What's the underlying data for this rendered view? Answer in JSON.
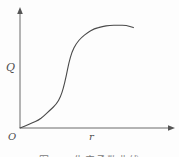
{
  "figure": {
    "y_axis_label": "Q",
    "x_axis_label": "r",
    "origin_label": "O",
    "caption": "图1-1 生产函数曲线"
  },
  "colors": {
    "axis": "#6b6b6b",
    "curve": "#4a4a4a",
    "label_text": "#4d4d4d",
    "background": "#fdfdfd"
  },
  "chart_data": {
    "type": "line",
    "title": "",
    "xlabel": "r",
    "ylabel": "Q",
    "origin_label": "O",
    "xlim": [
      0,
      1
    ],
    "ylim": [
      0,
      1
    ],
    "grid": false,
    "legend": "none",
    "tick_labels": "none (qualitative sketch, arrowhead axes)",
    "series": [
      {
        "name": "S-shaped growth curve",
        "points": [
          [
            0.0,
            0.0
          ],
          [
            0.04,
            0.02
          ],
          [
            0.09,
            0.05
          ],
          [
            0.13,
            0.07
          ],
          [
            0.17,
            0.11
          ],
          [
            0.21,
            0.16
          ],
          [
            0.26,
            0.22
          ],
          [
            0.29,
            0.29
          ],
          [
            0.31,
            0.37
          ],
          [
            0.33,
            0.48
          ],
          [
            0.35,
            0.61
          ],
          [
            0.37,
            0.7
          ],
          [
            0.4,
            0.78
          ],
          [
            0.44,
            0.84
          ],
          [
            0.48,
            0.88
          ],
          [
            0.53,
            0.92
          ],
          [
            0.59,
            0.94
          ],
          [
            0.64,
            0.95
          ],
          [
            0.7,
            0.952
          ],
          [
            0.76,
            0.952
          ],
          [
            0.81,
            0.93
          ]
        ]
      }
    ]
  }
}
